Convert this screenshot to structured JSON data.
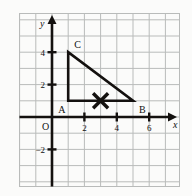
{
  "figure": {
    "title": "",
    "background_color": "#fbfbfa",
    "grid_color": "#b9bbba",
    "axis_color": "#14110f",
    "shape_color": "#14110f"
  },
  "axes": {
    "x_label": "x",
    "y_label": "y",
    "origin_label": "O",
    "x_ticks": [
      {
        "value": 2,
        "label": "2"
      },
      {
        "value": 4,
        "label": "4"
      },
      {
        "value": 6,
        "label": "6"
      }
    ],
    "y_ticks": [
      {
        "value": 4,
        "label": "4"
      },
      {
        "value": 2,
        "label": "2"
      },
      {
        "value": -2,
        "label": "−2"
      }
    ],
    "x_range": [
      -2,
      8
    ],
    "y_range": [
      -4,
      5
    ],
    "grid": true,
    "grid_step": 1
  },
  "chart_data": {
    "type": "scatter",
    "title": "",
    "xlabel": "x",
    "ylabel": "y",
    "xlim": [
      -2,
      8
    ],
    "ylim": [
      -4,
      5
    ],
    "grid": true,
    "legend": "none",
    "series": [
      {
        "name": "triangle-ABC",
        "type": "polygon",
        "closed": true,
        "points": [
          {
            "label": "A",
            "x": 1,
            "y": 1
          },
          {
            "label": "B",
            "x": 5,
            "y": 1
          },
          {
            "label": "C",
            "x": 1,
            "y": 4
          }
        ]
      },
      {
        "name": "x-marker",
        "type": "marker",
        "marker": "x-cross",
        "points": [
          {
            "label": "",
            "x": 3,
            "y": 1
          }
        ]
      }
    ],
    "vertex_labels": [
      {
        "text": "A",
        "x": 1,
        "y": 1,
        "anchor": "left-below"
      },
      {
        "text": "B",
        "x": 5,
        "y": 1,
        "anchor": "right-below"
      },
      {
        "text": "C",
        "x": 1,
        "y": 4,
        "anchor": "right-above"
      }
    ]
  }
}
